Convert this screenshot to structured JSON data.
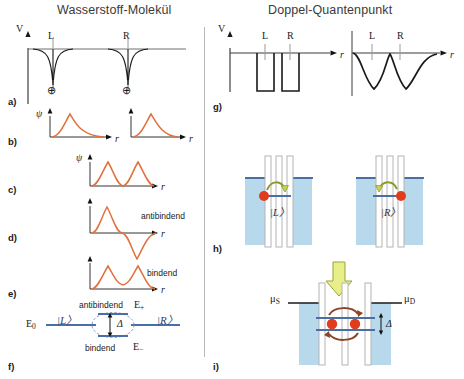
{
  "figure": {
    "left_title": "Wasserstoff-Molekül",
    "right_title": "Doppel-Quantenpunkt"
  },
  "panels": {
    "a": "a)",
    "b": "b)",
    "c": "c)",
    "d": "d)",
    "e": "e)",
    "f": "f)",
    "g": "g)",
    "h": "h)",
    "i": "i)"
  },
  "axes": {
    "potential_v": "V",
    "psi": "ψ",
    "r": "r"
  },
  "panel_a": {
    "well_left_label": "L",
    "well_right_label": "R",
    "nucleus_symbol": "⊕",
    "nucleus_left": "⊕",
    "nucleus_right": "⊕"
  },
  "panel_b": {
    "psi_label": "ψ",
    "r_left": "r",
    "r_right": "r"
  },
  "panel_c": {
    "psi_label": "ψ",
    "r_label": "r"
  },
  "panel_d": {
    "state_label": "antibindend",
    "r_label": "r"
  },
  "panel_e": {
    "state_label": "bindend",
    "r_label": "r"
  },
  "panel_f": {
    "e0_label": "E",
    "e0_sub": "0",
    "ket_left": "|L〉",
    "ket_right": "|R〉",
    "antibonding_label": "antibindend",
    "antibonding_energy": "E",
    "antibonding_energy_sub": "+",
    "bonding_label": "bindend",
    "bonding_energy": "E",
    "bonding_energy_sub": "−",
    "splitting": "Δ"
  },
  "panel_g": {
    "v_label": "V",
    "left_well_L": "L",
    "left_well_R": "R",
    "left_r": "r",
    "right_well_L": "L",
    "right_well_R": "R",
    "right_r": "r"
  },
  "panel_h": {
    "left_state": "|L〉",
    "right_state": "|R〉"
  },
  "panel_i": {
    "mu_source": "μ",
    "mu_source_sub": "S",
    "mu_drain": "μ",
    "mu_drain_sub": "D",
    "splitting": "Δ"
  },
  "colors": {
    "wavefunction": "#e1703c",
    "potential_line": "#1a1a1a",
    "energy_level": "#4a6fa5",
    "quantum_well_fill": "#b8d8ec",
    "electron": "#e03c1e",
    "tunnel_arrow": "#8a9a2a",
    "big_arrow": "#e8ee88",
    "divider": "#b9b9b9",
    "title": "#3a3a3a"
  }
}
